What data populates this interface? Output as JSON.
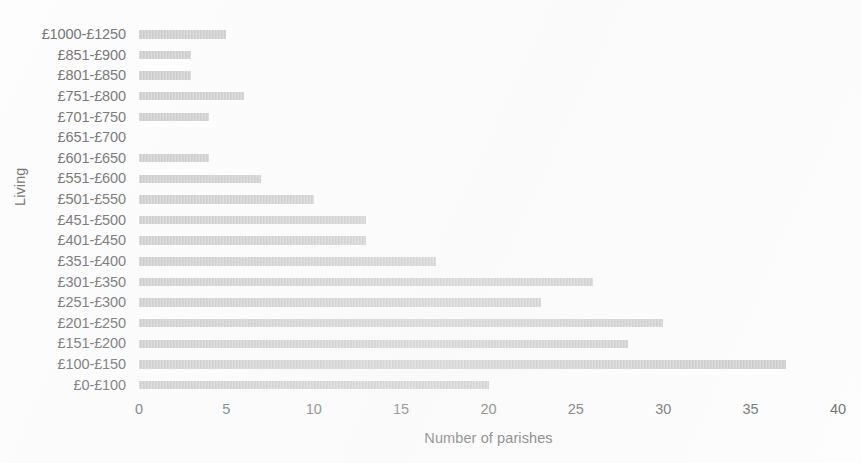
{
  "chart_data": {
    "type": "bar",
    "orientation": "horizontal",
    "title": "",
    "xlabel": "Number of parishes",
    "ylabel": "Living",
    "xlim": [
      0,
      40
    ],
    "xticks": [
      0,
      5,
      10,
      15,
      20,
      25,
      30,
      35,
      40
    ],
    "grid": false,
    "legend": false,
    "bar_color": "#c9c9c9",
    "text_color": "#6f6f6f",
    "background_color": "#fdfdfd",
    "categories": [
      "£1000-£1250",
      "£851-£900",
      "£801-£850",
      "£751-£800",
      "£701-£750",
      "£651-£700",
      "£601-£650",
      "£551-£600",
      "£501-£550",
      "£451-£500",
      "£401-£450",
      "£351-£400",
      "£301-£350",
      "£251-£300",
      "£201-£250",
      "£151-£200",
      "£100-£150",
      "£0-£100"
    ],
    "values": [
      5,
      3,
      3,
      6,
      4,
      0,
      4,
      7,
      10,
      13,
      13,
      17,
      26,
      23,
      30,
      28,
      37,
      20
    ]
  }
}
